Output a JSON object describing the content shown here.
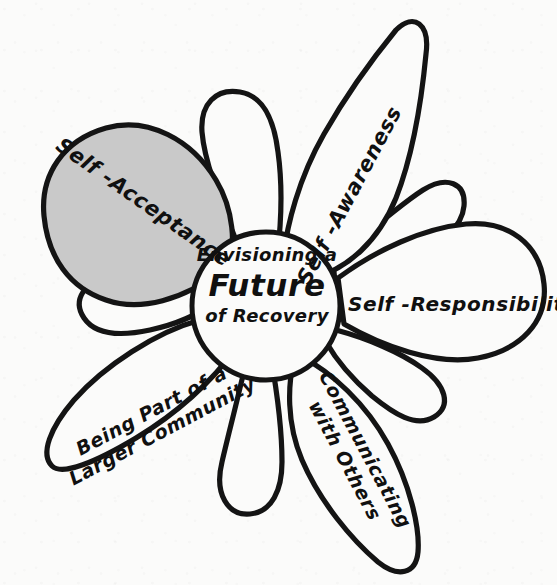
{
  "diagram": {
    "title": "Envisioning a Future of Recovery",
    "style": "hand-drawn flower / petal concept map",
    "background_color": "#fbfbfa",
    "ink_color": "#141414",
    "highlight_fill": "#c9c9c9"
  },
  "center": {
    "line1": "Envisioning a",
    "line2": "Future",
    "line3": "of Recovery"
  },
  "petals": [
    {
      "id": "self-acceptance",
      "label": "Self -Acceptance",
      "lines": [
        "Self -Acceptance"
      ],
      "shaded": true,
      "fill": "#c9c9c9",
      "position": "upper-left",
      "rotation_deg": 35
    },
    {
      "id": "self-awareness",
      "label": "Self -Awareness",
      "lines": [
        "Self -Awareness"
      ],
      "shaded": false,
      "fill": "#fbfbfa",
      "position": "upper-right",
      "rotation_deg": -62
    },
    {
      "id": "self-responsibility",
      "label": "Self -Responsibility",
      "lines": [
        "Self -Responsibility"
      ],
      "shaded": false,
      "fill": "#fbfbfa",
      "position": "right",
      "rotation_deg": 0
    },
    {
      "id": "communicating-with-others",
      "label": "Communicating with Others",
      "lines": [
        "Communicating",
        "with Others"
      ],
      "shaded": false,
      "fill": "#fbfbfa",
      "position": "lower-right",
      "rotation_deg": 62
    },
    {
      "id": "being-part-of-a-larger-community",
      "label": "Being Part of a Larger Community",
      "lines": [
        "Being Part of a",
        "Larger Community"
      ],
      "shaded": false,
      "fill": "#fbfbfa",
      "position": "lower-left",
      "rotation_deg": -28
    }
  ],
  "blank_petals": [
    {
      "id": "blank-top",
      "position": "top"
    },
    {
      "id": "blank-upper-right",
      "position": "upper-right"
    },
    {
      "id": "blank-lower-right",
      "position": "lower-right"
    },
    {
      "id": "blank-bottom",
      "position": "bottom"
    },
    {
      "id": "blank-left",
      "position": "left"
    }
  ]
}
